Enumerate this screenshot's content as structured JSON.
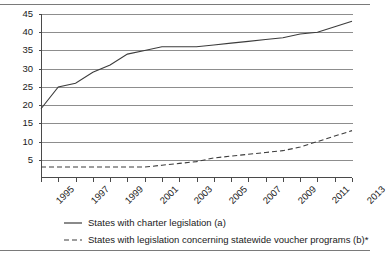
{
  "chart_data": {
    "type": "line",
    "title": "",
    "subtitle": "",
    "xlabel": "",
    "ylabel": "",
    "xlim": [
      1995,
      2013
    ],
    "ylim": [
      0,
      45
    ],
    "yticks": [
      5,
      10,
      15,
      20,
      25,
      30,
      35,
      40,
      45
    ],
    "ytick_labels": [
      "5",
      "10",
      "15",
      "20",
      "25",
      "30",
      "35",
      "40",
      "45"
    ],
    "grid": "horizontal",
    "legend_position": "below",
    "x": [
      1995,
      1996,
      1997,
      1998,
      1999,
      2000,
      2001,
      2002,
      2003,
      2004,
      2005,
      2006,
      2007,
      2008,
      2009,
      2010,
      2011,
      2012,
      2013
    ],
    "xtick_labels": [
      "1995",
      "1997",
      "1999",
      "2001",
      "2003",
      "2005",
      "2007",
      "2009",
      "2011",
      "2013"
    ],
    "xtick_values": [
      1995,
      1997,
      1999,
      2001,
      2003,
      2005,
      2007,
      2009,
      2011,
      2013
    ],
    "series": [
      {
        "name": "States with charter legislation (a)",
        "style": "solid",
        "color": "#3c3c3c",
        "values": [
          19,
          25,
          26,
          29,
          31,
          34,
          35,
          36,
          36,
          36,
          36.5,
          37,
          37.5,
          38,
          38.5,
          39.5,
          40,
          41.5,
          43
        ]
      },
      {
        "name": "States with legislation concerning statewide voucher programs (b)*",
        "style": "dashed",
        "color": "#3c3c3c",
        "values": [
          3,
          3,
          3,
          3,
          3,
          3,
          3,
          3.5,
          4,
          4.5,
          5.5,
          6,
          6.5,
          7,
          7.5,
          8.5,
          10,
          11.5,
          13
        ]
      }
    ]
  },
  "legend": {
    "items": [
      {
        "label": "States with charter legislation (a)",
        "style": "solid"
      },
      {
        "label": "States with legislation concerning statewide voucher programs (b)*",
        "style": "dashed"
      }
    ]
  }
}
